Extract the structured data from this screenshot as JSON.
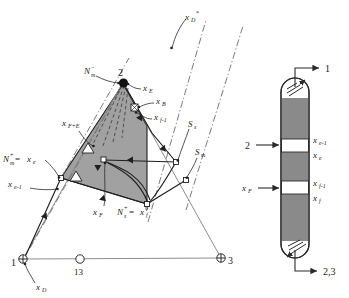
{
  "figure": {
    "background_color": "#ffffff",
    "line_color": "#2a2a2a",
    "shade_color": "#9a9a9a",
    "grey_line_color": "#8d8d8d"
  },
  "ternary": {
    "vertices": [
      {
        "id": "v1",
        "label": "1",
        "marker": "circled-plus",
        "x": 23,
        "y": 259
      },
      {
        "id": "v2",
        "label": "2",
        "marker": "filled-dot",
        "x": 123,
        "y": 82
      },
      {
        "id": "v3",
        "label": "3",
        "marker": "circled-plus",
        "x": 221,
        "y": 258
      }
    ],
    "azeotrope": {
      "label": "13",
      "marker": "open-circle",
      "x": 80,
      "y": 259
    },
    "labels": [
      {
        "key": "xD_base",
        "base": "x",
        "sub": "D",
        "sup": "",
        "x": 36,
        "y": 288
      },
      {
        "key": "xD_star",
        "base": "x",
        "sub": "D",
        "sup": "*",
        "x": 185,
        "y": 18
      },
      {
        "key": "xE",
        "base": "x",
        "sub": "E",
        "sup": "",
        "x": 142,
        "y": 89
      },
      {
        "key": "xB",
        "base": "x",
        "sub": "B",
        "sup": "",
        "x": 155,
        "y": 102
      },
      {
        "key": "xf_1",
        "base": "x",
        "sub": "f-1",
        "sup": "",
        "x": 153,
        "y": 118
      },
      {
        "key": "xFE",
        "base": "x",
        "sub": "F+E",
        "sup": "",
        "x": 64,
        "y": 125
      },
      {
        "key": "xe_1",
        "base": "x",
        "sub": "e-1",
        "sup": "",
        "x": 8,
        "y": 185
      },
      {
        "key": "xF",
        "base": "x",
        "sub": "F",
        "sup": "",
        "x": 95,
        "y": 213
      },
      {
        "key": "Ss",
        "base": "S",
        "sub": "s",
        "sup": "",
        "x": 188,
        "y": 125
      },
      {
        "key": "Sm",
        "base": "S",
        "sub": "m",
        "sup": "",
        "x": 195,
        "y": 153
      }
    ],
    "composite_labels": [
      {
        "key": "Nm_minus",
        "base": "N",
        "sub": "m",
        "sup": "−",
        "x": 84,
        "y": 72
      },
      {
        "key": "Nm_plus_eq_xe",
        "base": "N",
        "sub": "m",
        "sup": "+",
        "eq": " = ",
        "eq_base": "x",
        "eq_sub": "e",
        "x": 4,
        "y": 160
      },
      {
        "key": "Ns_plus_eq_xf",
        "base": "N",
        "sub": "s",
        "sup": "+",
        "eq": " = ",
        "eq_base": "x",
        "eq_sub": "f",
        "x": 118,
        "y": 213
      }
    ]
  },
  "column": {
    "top_stream_label": "1",
    "side_feed_label": "2",
    "feed_label_base": "x",
    "feed_label_sub": "F",
    "bottom_stream_label": "2,3",
    "stage_labels": [
      {
        "base": "x",
        "sub": "e-1",
        "x": 312,
        "y": 143
      },
      {
        "base": "x",
        "sub": "e",
        "x": 312,
        "y": 157
      },
      {
        "base": "x",
        "sub": "f-1",
        "x": 312,
        "y": 186
      },
      {
        "base": "x",
        "sub": "f",
        "x": 312,
        "y": 200
      }
    ]
  }
}
